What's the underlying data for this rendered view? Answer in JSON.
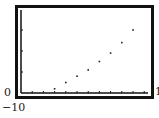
{
  "chart_data": {
    "type": "scatter",
    "title": "",
    "xlabel": "",
    "ylabel": "",
    "window_labels": {
      "xmin": "0",
      "xmax": "1",
      "ymin": "−10"
    },
    "x": [
      3,
      4,
      5,
      6,
      7,
      8,
      9,
      10
    ],
    "y": [
      2,
      5,
      8,
      11,
      15,
      19,
      24,
      30
    ],
    "x_ticks": [
      1,
      2,
      3,
      4,
      5,
      6,
      7,
      8,
      9,
      10,
      11
    ],
    "y_ticks": [
      10,
      20,
      30
    ],
    "grid": false,
    "legend": null,
    "colors": {
      "frame": "#111111",
      "points": "#222222",
      "axes": "#111111"
    }
  }
}
